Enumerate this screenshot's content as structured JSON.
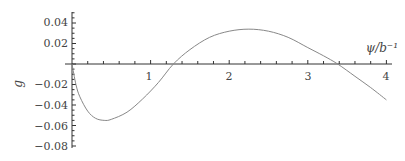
{
  "chart_data": {
    "type": "line",
    "title": "",
    "xlabel": "ψ/b⁻¹",
    "ylabel": "g",
    "xlim": [
      0,
      4.05
    ],
    "ylim": [
      -0.08,
      0.05
    ],
    "grid": false,
    "legend": null,
    "x_ticks": [
      "1",
      "2",
      "3",
      "4"
    ],
    "y_ticks": [
      "0.04",
      "0.02",
      "-0.02",
      "-0.04",
      "-0.06",
      "-0.08"
    ],
    "series": [
      {
        "name": "g",
        "x": [
          0,
          0.05,
          0.1,
          0.2,
          0.3,
          0.41,
          0.5,
          0.7,
          0.9,
          1.1,
          1.29,
          1.5,
          1.75,
          2.0,
          2.25,
          2.5,
          2.75,
          3.0,
          3.2,
          3.38,
          3.6,
          3.8,
          4.0
        ],
        "y": [
          0,
          -0.02,
          -0.032,
          -0.046,
          -0.053,
          -0.055,
          -0.054,
          -0.047,
          -0.034,
          -0.018,
          0,
          0.014,
          0.026,
          0.032,
          0.034,
          0.032,
          0.026,
          0.016,
          0.008,
          0,
          -0.012,
          -0.023,
          -0.035
        ]
      }
    ],
    "color": "#888888"
  },
  "labels": {
    "xlabel": "ψ/b⁻¹",
    "ylabel": "g",
    "x1": "1",
    "x2": "2",
    "x3": "3",
    "x4": "4",
    "y004": "0.04",
    "y002": "0.02",
    "ym002": "−0.02",
    "ym004": "−0.04",
    "ym006": "−0.06",
    "ym008": "−0.08"
  }
}
